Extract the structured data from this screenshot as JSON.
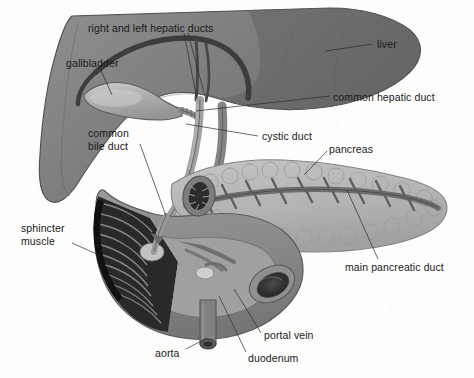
{
  "figure": {
    "kind": "anatomical-illustration",
    "style": "grayscale medical line drawing",
    "background_color": "#fdfdfc"
  },
  "palette": {
    "liver_right_lobe": "#6e6e6e",
    "liver_left_lobe": "#8c8c8c",
    "liver_edge": "#4a4a4a",
    "gallbladder": "#a7a7a7",
    "gallbladder_highlight": "#c3c3c3",
    "duct_fill": "#9a9a9a",
    "duct_dark": "#5a5a5a",
    "pancreas": "#b9b9b9",
    "pancreas_lobule_edge": "#9d9d9d",
    "pancreatic_duct": "#6a6a6a",
    "duodenum": "#8a8a8a",
    "duodenum_interior": "#9f9f9f",
    "sphincter_folds": "#262626",
    "lumen_dark": "#3a3a3a",
    "aorta": "#7e7e7e",
    "leader_line": "#2b2b2b",
    "label_text": "#1a1a1a"
  },
  "labels": [
    {
      "id": "right-and-left-hepatic-ducts",
      "text": "right and left hepatic ducts",
      "x": 88,
      "y": 22,
      "align": "left",
      "leaders": [
        {
          "x1": 184,
          "y1": 33,
          "x2": 197,
          "y2": 99
        },
        {
          "x1": 188,
          "y1": 33,
          "x2": 206,
          "y2": 100
        }
      ]
    },
    {
      "id": "liver",
      "text": "liver",
      "x": 377,
      "y": 38,
      "align": "left",
      "leaders": [
        {
          "x1": 372,
          "y1": 44,
          "x2": 326,
          "y2": 51
        }
      ]
    },
    {
      "id": "gallbladder",
      "text": "gallbladder",
      "x": 66,
      "y": 57,
      "align": "left",
      "leaders": [
        {
          "x1": 100,
          "y1": 68,
          "x2": 112,
          "y2": 95
        }
      ]
    },
    {
      "id": "common-hepatic-duct",
      "text": "common hepatic duct",
      "x": 333,
      "y": 91,
      "align": "left",
      "leaders": [
        {
          "x1": 330,
          "y1": 96,
          "x2": 196,
          "y2": 111
        }
      ]
    },
    {
      "id": "common-bile-duct",
      "text": "common\nbile duct",
      "x": 88,
      "y": 127,
      "align": "left",
      "leaders": [
        {
          "x1": 140,
          "y1": 144,
          "x2": 166,
          "y2": 216
        }
      ]
    },
    {
      "id": "cystic-duct",
      "text": "cystic duct",
      "x": 262,
      "y": 130,
      "align": "left",
      "leaders": [
        {
          "x1": 258,
          "y1": 136,
          "x2": 186,
          "y2": 124
        }
      ]
    },
    {
      "id": "pancreas",
      "text": "pancreas",
      "x": 329,
      "y": 143,
      "align": "left",
      "leaders": [
        {
          "x1": 327,
          "y1": 151,
          "x2": 304,
          "y2": 175
        }
      ]
    },
    {
      "id": "sphincter-muscle",
      "text": "sphincter\nmuscle",
      "x": 21,
      "y": 222,
      "align": "left",
      "leaders": [
        {
          "x1": 72,
          "y1": 243,
          "x2": 99,
          "y2": 255
        }
      ]
    },
    {
      "id": "main-pancreatic-duct",
      "text": "main pancreatic duct",
      "x": 345,
      "y": 261,
      "align": "left",
      "leaders": [
        {
          "x1": 378,
          "y1": 259,
          "x2": 347,
          "y2": 190
        }
      ]
    },
    {
      "id": "portal-vein",
      "text": "portal vein",
      "x": 264,
      "y": 329,
      "align": "left",
      "leaders": [
        {
          "x1": 261,
          "y1": 333,
          "x2": 234,
          "y2": 289
        }
      ]
    },
    {
      "id": "aorta",
      "text": "aorta",
      "x": 155,
      "y": 347,
      "align": "left",
      "leaders": [
        {
          "x1": 186,
          "y1": 349,
          "x2": 207,
          "y2": 338
        }
      ]
    },
    {
      "id": "duodenum",
      "text": "duodenum",
      "x": 248,
      "y": 352,
      "align": "left",
      "leaders": [
        {
          "x1": 246,
          "y1": 352,
          "x2": 219,
          "y2": 296
        }
      ]
    }
  ],
  "structures": [
    {
      "id": "liver",
      "label": "liver"
    },
    {
      "id": "gallbladder",
      "label": "gallbladder"
    },
    {
      "id": "right-and-left-hepatic-ducts",
      "label": "right and left hepatic ducts"
    },
    {
      "id": "common-hepatic-duct",
      "label": "common hepatic duct"
    },
    {
      "id": "cystic-duct",
      "label": "cystic duct"
    },
    {
      "id": "common-bile-duct",
      "label": "common bile duct"
    },
    {
      "id": "pancreas",
      "label": "pancreas"
    },
    {
      "id": "main-pancreatic-duct",
      "label": "main pancreatic duct"
    },
    {
      "id": "duodenum",
      "label": "duodenum"
    },
    {
      "id": "sphincter-muscle",
      "label": "sphincter muscle"
    },
    {
      "id": "portal-vein",
      "label": "portal vein"
    },
    {
      "id": "aorta",
      "label": "aorta"
    }
  ]
}
